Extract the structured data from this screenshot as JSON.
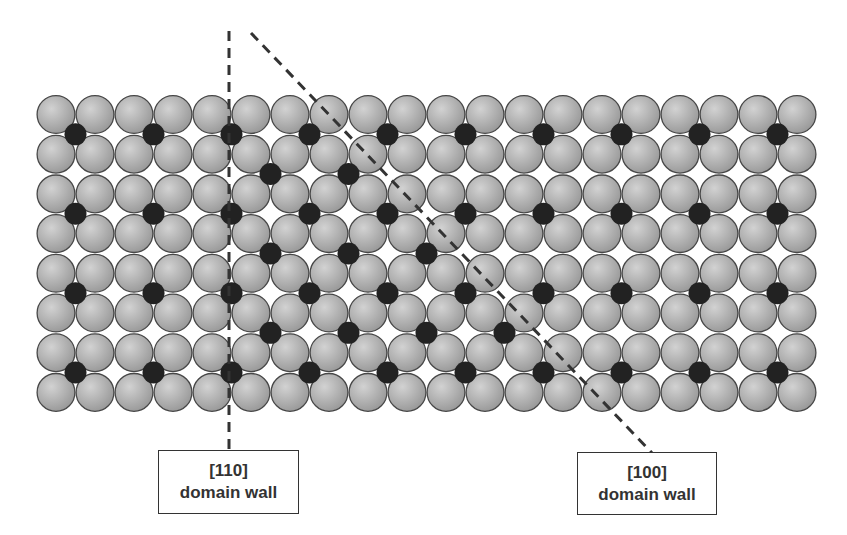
{
  "diagram": {
    "type": "atomic-lattice-domain-walls",
    "colors": {
      "background": "#ffffff",
      "large_atom_light": "#d2d2d2",
      "large_atom_dark": "#979797",
      "large_atom_outline": "#474747",
      "small_atom": "#222222",
      "dash_line": "#333333"
    },
    "lattice": {
      "columns": 20,
      "rows": 8,
      "origin_x": 56,
      "origin_y": 114.5,
      "pitch_x": 39,
      "pitch_y": 39.7,
      "large_radius": 19.5,
      "small_radius": 11
    },
    "small_atoms": {
      "description": "interstitial sites: row k lies between atom rows k and k+1, column j between atom columns j and j+1",
      "rows": [
        {
          "row": 0,
          "cols": [
            0,
            2,
            4,
            6,
            8,
            10,
            12,
            14,
            16,
            18
          ]
        },
        {
          "row": 1,
          "cols": [
            5,
            7
          ]
        },
        {
          "row": 2,
          "cols": [
            0,
            2,
            4,
            6,
            8,
            10,
            12,
            14,
            16,
            18
          ]
        },
        {
          "row": 3,
          "cols": [
            5,
            7,
            9
          ]
        },
        {
          "row": 4,
          "cols": [
            0,
            2,
            4,
            6,
            8,
            10,
            12,
            14,
            16,
            18
          ]
        },
        {
          "row": 5,
          "cols": [
            5,
            7,
            9,
            11
          ]
        },
        {
          "row": 6,
          "cols": [
            0,
            2,
            4,
            6,
            8,
            10,
            12,
            14,
            16,
            18
          ]
        }
      ]
    },
    "domain_walls": [
      {
        "id": "wall-110",
        "direction": "[110]",
        "line": {
          "x1": 229,
          "y1": 31,
          "x2": 229,
          "y2": 452
        },
        "label": {
          "line1": "[110]",
          "line2": "domain wall",
          "x": 158,
          "y": 450,
          "w": 141,
          "h": 64
        }
      },
      {
        "id": "wall-100",
        "direction": "[100]",
        "line": {
          "x1": 251,
          "y1": 33,
          "x2": 652,
          "y2": 453
        },
        "label": {
          "line1": "[100]",
          "line2": "domain wall",
          "x": 577,
          "y": 452,
          "w": 140,
          "h": 63
        }
      }
    ]
  }
}
